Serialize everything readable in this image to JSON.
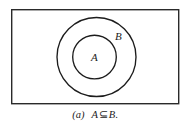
{
  "figure": {
    "name": "venn-diagram-subset",
    "universe_rect_label": "",
    "colors": {
      "background": "#ffffff",
      "stroke": "#1c1c1c",
      "text": "#1c1c1c",
      "fill": "#ffffff"
    },
    "sets": [
      {
        "id": "outer-set",
        "label": "B",
        "shape": "circle",
        "cx": 96.5,
        "cy": 57,
        "r": 40,
        "label_x": 115,
        "label_y": 31
      },
      {
        "id": "inner-set",
        "label": "A",
        "shape": "circle",
        "cx": 94.5,
        "cy": 57,
        "r": 22,
        "label_x": 91,
        "label_y": 52
      }
    ],
    "universe": {
      "x": 11,
      "y": 9,
      "width": 168,
      "height": 95,
      "stroke_width": 1.4
    }
  },
  "caption": {
    "index": "(a)",
    "left_operand": "A",
    "operator": "⊆",
    "right_operand": "B",
    "terminator": ".",
    "full_text": "(a)   A ⊆ B."
  }
}
